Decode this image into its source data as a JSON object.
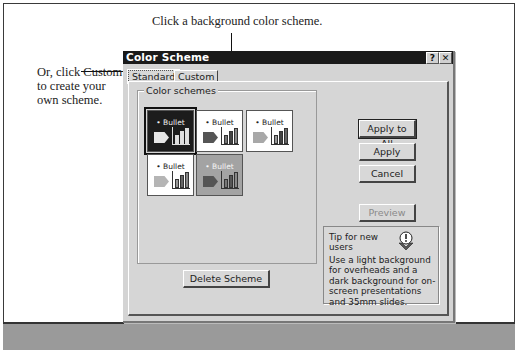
{
  "callouts": {
    "top": "Click a background color scheme.",
    "left": "Or, click Custom to create your own scheme."
  },
  "dialog": {
    "title": "Color Scheme",
    "help_button": "?",
    "close_button": "✕",
    "tabs": [
      {
        "label": "Standard",
        "active": true
      },
      {
        "label": "Custom",
        "active": false
      }
    ],
    "group_label": "Color schemes",
    "schemes": [
      {
        "label": "• Bullet",
        "bg": "#1c1c1c",
        "fg": "#f0f0f0",
        "shape": "#e6e6e6",
        "bars": [
          "#e0e0e0",
          "#e0e0e0",
          "#e0e0e0"
        ],
        "axis": "#ddd",
        "selected": true
      },
      {
        "label": "• Bullet",
        "bg": "#ffffff",
        "fg": "#222",
        "shape": "#555555",
        "bars": [
          "#777",
          "#444",
          "#888"
        ],
        "axis": "#333",
        "selected": false
      },
      {
        "label": "• Bullet",
        "bg": "#ffffff",
        "fg": "#222",
        "shape": "#a8a8a8",
        "bars": [
          "#999",
          "#444",
          "#666"
        ],
        "axis": "#333",
        "selected": false
      },
      {
        "label": "• Bullet",
        "bg": "#ffffff",
        "fg": "#222",
        "shape": "#b5b5b5",
        "bars": [
          "#999",
          "#666",
          "#888"
        ],
        "axis": "#333",
        "selected": false
      },
      {
        "label": "• Bullet",
        "bg": "#a3a3a3",
        "fg": "#f5f5f5",
        "shape": "#555555",
        "bars": [
          "#777",
          "#555",
          "#888"
        ],
        "axis": "#333",
        "selected": false
      }
    ],
    "buttons": {
      "apply_to_all": "Apply to All",
      "apply": "Apply",
      "cancel": "Cancel",
      "preview": "Preview",
      "delete_scheme": "Delete Scheme"
    },
    "tip": {
      "title": "Tip for new users",
      "body": "Use a light background for overheads and a dark background for on-screen presentations and 35mm slides."
    }
  }
}
